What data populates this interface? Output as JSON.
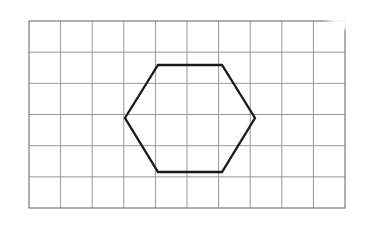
{
  "figure": {
    "background_color": "#ffffff"
  },
  "grid": {
    "name": "square-grid",
    "columns": 10,
    "rows": 6,
    "x": 29,
    "y": 21,
    "width": 316,
    "height": 187,
    "cell_width": 31.6,
    "cell_height": 31.17,
    "line_color": "#8b8b8b",
    "border_color": "#7a7a7a",
    "line_width": 0.9,
    "border_width": 1.2
  },
  "shape": {
    "name": "hexagon",
    "sides": 6,
    "type": "regular-hexagon",
    "stroke_color": "#1a1a1a",
    "stroke_width": 2.3,
    "fill": "none",
    "points": "125,118 158,65 222,65 255,118 222,172 158,172",
    "vertices": [
      {
        "label": "left",
        "x": 125,
        "y": 118
      },
      {
        "label": "top-left",
        "x": 158,
        "y": 65
      },
      {
        "label": "top-right",
        "x": 222,
        "y": 65
      },
      {
        "label": "right",
        "x": 255,
        "y": 118
      },
      {
        "label": "bottom-right",
        "x": 222,
        "y": 172
      },
      {
        "label": "bottom-left",
        "x": 158,
        "y": 172
      }
    ],
    "center": {
      "x": 190,
      "y": 118.5
    }
  },
  "artifact": {
    "name": "scan-fade-top-right",
    "description": "Washed-out lighter region in the upper right corner of the scan",
    "x": 288,
    "y": 18,
    "width": 78,
    "height": 34
  }
}
